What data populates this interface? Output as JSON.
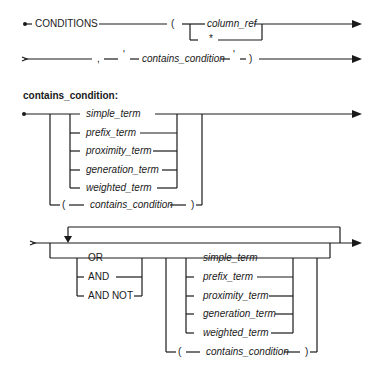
{
  "diagram": {
    "type": "railroad-syntax-diagram",
    "main": {
      "keyword": "CONDITIONS",
      "open_paren": "(",
      "column_ref": "column_ref",
      "star": "*",
      "comma": ",",
      "quote_open": "'",
      "contains_condition": "contains_condition",
      "quote_close": "'",
      "close_paren": ")"
    },
    "contains_condition_section": {
      "heading": "contains_condition:",
      "terms": [
        "simple_term",
        "prefix_term",
        "proximity_term",
        "generation_term",
        "weighted_term"
      ],
      "nested": {
        "open_paren": "(",
        "label": "contains_condition",
        "close_paren": ")"
      }
    },
    "repeat_section": {
      "operators": [
        "OR",
        "AND",
        "AND NOT"
      ],
      "terms": [
        "simple_term",
        "prefix_term",
        "proximity_term",
        "generation_term",
        "weighted_term"
      ],
      "nested": {
        "open_paren": "(",
        "label": "contains_condition",
        "close_paren": ")"
      }
    }
  }
}
